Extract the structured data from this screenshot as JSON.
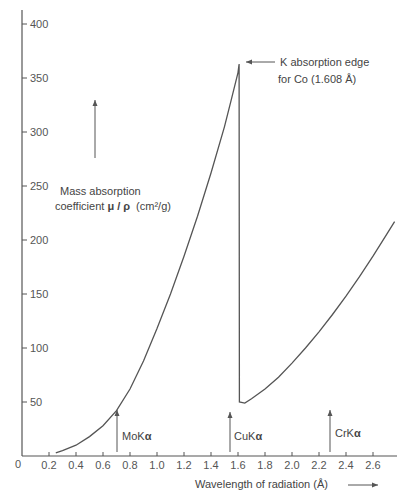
{
  "chart_data": {
    "type": "line",
    "title": "",
    "xlabel": "Wavelength of radiation (Å)",
    "ylabel": "Mass absorption coefficient μ/ρ (cm²/g)",
    "xlim": [
      0,
      2.75
    ],
    "ylim": [
      0,
      400
    ],
    "grid": false,
    "legend": null,
    "x_ticks": [
      "0",
      "0.2",
      "0.4",
      "0.6",
      "0.8",
      "1.0",
      "1.2",
      "1.4",
      "1.6",
      "1.8",
      "2.0",
      "2.2",
      "2.4",
      "2.6"
    ],
    "y_ticks": [
      "50",
      "100",
      "150",
      "200",
      "250",
      "300",
      "350",
      "400"
    ],
    "series": [
      {
        "name": "Cobalt mass absorption coefficient",
        "x": [
          0.25,
          0.3,
          0.4,
          0.5,
          0.6,
          0.7,
          0.8,
          0.9,
          1.0,
          1.1,
          1.2,
          1.3,
          1.4,
          1.5,
          1.55,
          1.6,
          1.608,
          1.61,
          1.65,
          1.7,
          1.8,
          1.9,
          2.0,
          2.1,
          2.2,
          2.3,
          2.4,
          2.5,
          2.6,
          2.7,
          2.76
        ],
        "y": [
          3,
          5,
          10,
          18,
          28,
          42,
          62,
          88,
          118,
          150,
          185,
          222,
          262,
          305,
          330,
          355,
          363,
          50,
          49,
          53,
          62,
          73,
          86,
          100,
          115,
          131,
          148,
          166,
          185,
          205,
          217
        ]
      }
    ],
    "annotations": [
      {
        "text": "K absorption edge",
        "text2": "for Co (1.608 Å)",
        "x": 1.608,
        "y": 363,
        "arrow": "left"
      },
      {
        "text": "MoKα",
        "x": 0.71,
        "y": 42,
        "arrow": "up"
      },
      {
        "text": "CuKα",
        "x": 1.54,
        "y": 0,
        "arrow": "up"
      },
      {
        "text": "CrKα",
        "x": 2.29,
        "y": 0,
        "arrow": "up"
      },
      {
        "text": "Mass absorption",
        "text2": "coefficient μ/ρ (cm²/g)",
        "arrow": "up"
      }
    ]
  },
  "labels": {
    "origin": "0",
    "xlabel": "Wavelength of radiation (Å)",
    "ylabel_line1": "Mass absorption",
    "ylabel_line2_prefix": "coefficient ",
    "ylabel_symbol": "μ / ρ",
    "ylabel_units": "(cm²/g)",
    "edge_line1": "K absorption edge",
    "edge_line2": "for Co (1.608 Å)",
    "mo": "MoK",
    "cu": "CuK",
    "cr": "CrK",
    "alpha": "α"
  },
  "colors": {
    "axis": "#555555",
    "curve": "#555555",
    "text": "#444444"
  }
}
